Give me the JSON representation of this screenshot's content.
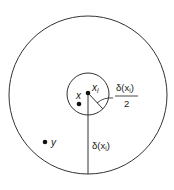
{
  "diagram": {
    "outer_circle": {
      "cx": 88,
      "cy": 95,
      "r": 79
    },
    "inner_circle": {
      "cx": 88,
      "cy": 94,
      "r": 21
    },
    "points": {
      "xi": {
        "label": "x",
        "subscript": "i",
        "cx": 88,
        "cy": 93
      },
      "x": {
        "label": "x",
        "cx": 79,
        "cy": 104
      },
      "y": {
        "label": "y",
        "cx": 45,
        "cy": 142
      }
    },
    "radius_labels": {
      "outer": {
        "delta": "δ(x",
        "sub": "i",
        "close": ")"
      },
      "inner": {
        "delta": "δ(x",
        "sub": "i",
        "close": ")",
        "denominator": "2"
      }
    },
    "colors": {
      "stroke": "#333333",
      "text": "#1a1a1a"
    }
  }
}
